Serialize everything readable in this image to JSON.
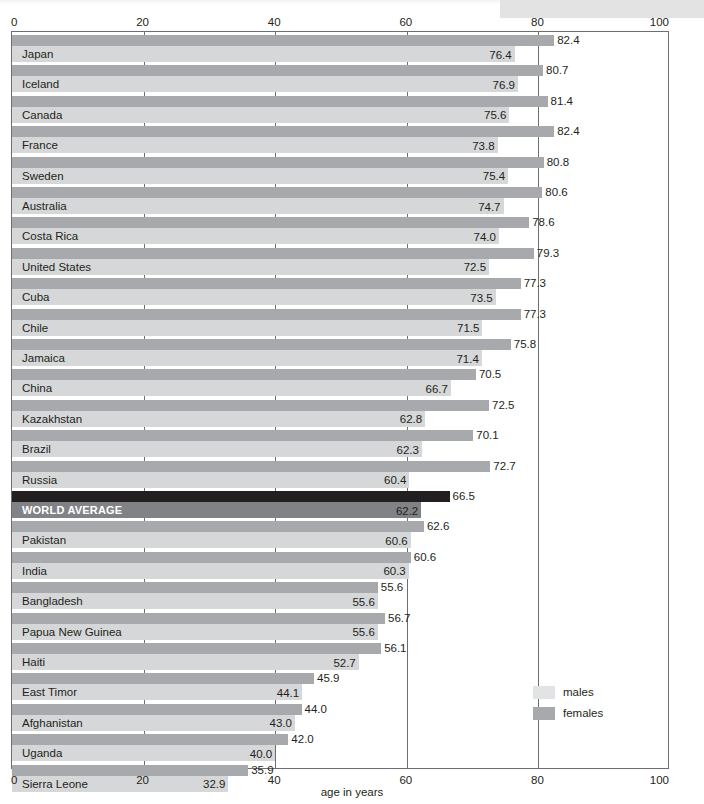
{
  "chart_data": {
    "type": "bar",
    "orientation": "horizontal",
    "title": "",
    "xlabel": "age in years",
    "ylabel": "",
    "xlim": [
      0,
      100
    ],
    "xticks": [
      0,
      20,
      40,
      60,
      80,
      100
    ],
    "grid": true,
    "legend_position": "bottom-right",
    "categories": [
      "Japan",
      "Iceland",
      "Canada",
      "France",
      "Sweden",
      "Australia",
      "Costa Rica",
      "United States",
      "Cuba",
      "Chile",
      "Jamaica",
      "China",
      "Kazakhstan",
      "Brazil",
      "Russia",
      "WORLD AVERAGE",
      "Pakistan",
      "India",
      "Bangladesh",
      "Papua New Guinea",
      "Haiti",
      "East Timor",
      "Afghanistan",
      "Uganda",
      "Sierra Leone"
    ],
    "series": [
      {
        "name": "females",
        "color": "#a7a9ac",
        "values": [
          82.4,
          80.7,
          81.4,
          82.4,
          80.8,
          80.6,
          78.6,
          79.3,
          77.3,
          77.3,
          75.8,
          70.5,
          72.5,
          70.1,
          72.7,
          66.5,
          62.6,
          60.6,
          55.6,
          56.7,
          56.1,
          45.9,
          44.0,
          42.0,
          35.9
        ]
      },
      {
        "name": "males",
        "color": "#d6d7d8",
        "values": [
          76.4,
          76.9,
          75.6,
          73.8,
          75.4,
          74.7,
          74.0,
          72.5,
          73.5,
          71.5,
          71.4,
          66.7,
          62.8,
          62.3,
          60.4,
          62.2,
          60.6,
          60.3,
          55.6,
          55.6,
          52.7,
          44.1,
          43.0,
          40.0,
          32.9
        ]
      }
    ],
    "highlight_row": "WORLD AVERAGE",
    "highlight_colors": {
      "females": "#231f20",
      "males": "#808285"
    }
  },
  "axis": {
    "top_ticks": [
      "0",
      "20",
      "40",
      "60",
      "80",
      "100"
    ],
    "bottom_ticks": [
      "0",
      "20",
      "40",
      "60",
      "80",
      "100"
    ],
    "x_title": "age in years"
  },
  "legend": {
    "items": [
      {
        "label": "males",
        "color": "#e2e3e4"
      },
      {
        "label": "females",
        "color": "#a7a9ac"
      }
    ]
  }
}
